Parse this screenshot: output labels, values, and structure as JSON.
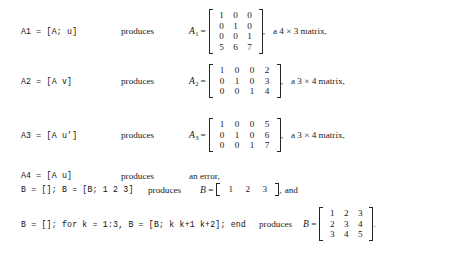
{
  "document": {
    "kind": "matlab-matrix-examples",
    "produces_label": "produces",
    "equals": "=",
    "comma": ",",
    "period": "."
  },
  "rows": [
    {
      "id": "a1",
      "code": "A1 = [A; u]",
      "produces": "produces",
      "result_var": "A",
      "result_sub": "1",
      "matrix": [
        [
          "1",
          "0",
          "0"
        ],
        [
          "0",
          "1",
          "0"
        ],
        [
          "0",
          "0",
          "1"
        ],
        [
          "5",
          "6",
          "7"
        ]
      ],
      "punct": ",",
      "trailer": "a 4 × 3 matrix,"
    },
    {
      "id": "a2",
      "code": "A2 = [A v]",
      "produces": "produces",
      "result_var": "A",
      "result_sub": "2",
      "matrix": [
        [
          "1",
          "0",
          "0",
          "2"
        ],
        [
          "0",
          "1",
          "0",
          "3"
        ],
        [
          "0",
          "0",
          "1",
          "4"
        ]
      ],
      "punct": ",",
      "trailer": "a 3 × 4 matrix,"
    },
    {
      "id": "a3",
      "code": "A3 = [A u’]",
      "produces": "produces",
      "result_var": "A",
      "result_sub": "3",
      "matrix": [
        [
          "1",
          "0",
          "0",
          "5"
        ],
        [
          "0",
          "1",
          "0",
          "6"
        ],
        [
          "0",
          "0",
          "1",
          "7"
        ]
      ],
      "punct": ",",
      "trailer": "a 3 × 4 matrix,"
    },
    {
      "id": "a4",
      "code": "A4 = [A u]",
      "produces": "produces",
      "error_text": "an error,"
    },
    {
      "id": "b1",
      "code": "B = []; B = [B; 1 2 3]",
      "produces": "produces",
      "result_var": "B",
      "result_sub": "",
      "matrix": [
        [
          "1",
          "2",
          "3"
        ]
      ],
      "punct": ",",
      "trailer": "and"
    },
    {
      "id": "b2",
      "code": "B = []; for k = 1:3, B = [B; k k+1 k+2]; end",
      "produces": "produces",
      "result_var": "B",
      "result_sub": "",
      "matrix": [
        [
          "1",
          "2",
          "3"
        ],
        [
          "2",
          "3",
          "4"
        ],
        [
          "3",
          "4",
          "5"
        ]
      ],
      "punct": ".",
      "trailer": ""
    }
  ],
  "colors": {
    "text": "#1a1a1a",
    "bracket": "#262626",
    "background": "#ffffff"
  }
}
